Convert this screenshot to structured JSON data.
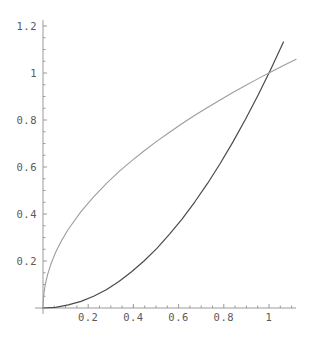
{
  "chart_data": {
    "type": "line",
    "title": "",
    "xlabel": "",
    "ylabel": "",
    "xlim": [
      0,
      1.12
    ],
    "ylim": [
      0,
      1.225
    ],
    "grid": false,
    "legend": "none",
    "background": "#ffffff",
    "axis_color": "#9a9a9a",
    "xticks": [
      0.2,
      0.4,
      0.6,
      0.8,
      1
    ],
    "xtick_labels": [
      "0.2",
      "0.4",
      "0.6",
      "0.8",
      "1"
    ],
    "yticks": [
      0.2,
      0.4,
      0.6,
      0.8,
      1,
      1.2
    ],
    "ytick_labels": [
      "0.2",
      "0.4",
      "0.6",
      "0.8",
      "1",
      "1.2"
    ],
    "series": [
      {
        "name": "y = x^2",
        "color": "#4a4a4a",
        "width": 1.2,
        "x": [
          0,
          0.056,
          0.112,
          0.168,
          0.224,
          0.28,
          0.336,
          0.392,
          0.448,
          0.504,
          0.56,
          0.616,
          0.672,
          0.728,
          0.784,
          0.84,
          0.896,
          0.952,
          1.008,
          1.064,
          1.12
        ],
        "y": [
          0,
          0.003,
          0.013,
          0.028,
          0.05,
          0.078,
          0.113,
          0.154,
          0.201,
          0.254,
          0.314,
          0.379,
          0.452,
          0.53,
          0.615,
          0.706,
          0.803,
          0.906,
          1.016,
          1.132,
          1.254
        ]
      },
      {
        "name": "y = sqrt(x)",
        "color": "#9d9d9d",
        "width": 1.1,
        "x": [
          0,
          0.003,
          0.01,
          0.02,
          0.035,
          0.056,
          0.084,
          0.112,
          0.168,
          0.224,
          0.28,
          0.336,
          0.392,
          0.448,
          0.504,
          0.56,
          0.616,
          0.672,
          0.728,
          0.784,
          0.84,
          0.896,
          0.952,
          1.008,
          1.064,
          1.12
        ],
        "y": [
          0,
          0.055,
          0.1,
          0.141,
          0.187,
          0.237,
          0.29,
          0.335,
          0.41,
          0.473,
          0.529,
          0.58,
          0.626,
          0.669,
          0.71,
          0.748,
          0.785,
          0.82,
          0.853,
          0.885,
          0.917,
          0.947,
          0.976,
          1.004,
          1.032,
          1.058
        ]
      }
    ]
  }
}
